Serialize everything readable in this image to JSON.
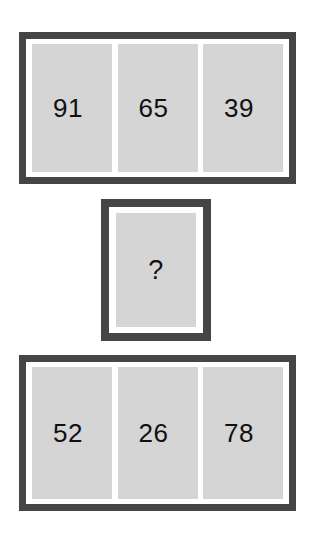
{
  "puzzle": {
    "type": "number-sequence-puzzle",
    "background_color": "#ffffff",
    "frame_color": "#454545",
    "cell_color": "#d5d5d5",
    "text_color": "#101010",
    "groups": [
      {
        "id": "top-row",
        "layout": "row",
        "cells": [
          {
            "value": "91"
          },
          {
            "value": "65"
          },
          {
            "value": "39"
          }
        ]
      },
      {
        "id": "middle-single",
        "layout": "single",
        "cells": [
          {
            "value": "?"
          }
        ]
      },
      {
        "id": "bottom-row",
        "layout": "row",
        "cells": [
          {
            "value": "52"
          },
          {
            "value": "26"
          },
          {
            "value": "78"
          }
        ]
      }
    ]
  }
}
